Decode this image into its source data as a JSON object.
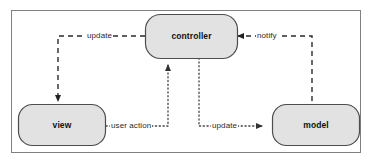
{
  "diagram": {
    "frame": {
      "border_color": "#808080",
      "background": "#ffffff"
    },
    "node_style": {
      "fill": "#e2e2e2",
      "stroke": "#4d4d4d",
      "text_color": "#111111"
    },
    "edge_style": {
      "dashed_color": "#333333",
      "dotted_color": "#555555"
    },
    "nodes": [
      {
        "id": "controller",
        "label": "controller"
      },
      {
        "id": "view",
        "label": "view"
      },
      {
        "id": "model",
        "label": "model"
      }
    ],
    "edges": [
      {
        "id": "controller-to-view",
        "label": "update",
        "from": "controller",
        "to": "view",
        "line": "dashed"
      },
      {
        "id": "model-to-controller",
        "label": "notify",
        "from": "model",
        "to": "controller",
        "line": "dashed"
      },
      {
        "id": "view-to-controller",
        "label": "user action",
        "from": "view",
        "to": "controller",
        "line": "dotted"
      },
      {
        "id": "controller-to-model",
        "label": "update",
        "from": "controller",
        "to": "model",
        "line": "dotted"
      }
    ]
  }
}
